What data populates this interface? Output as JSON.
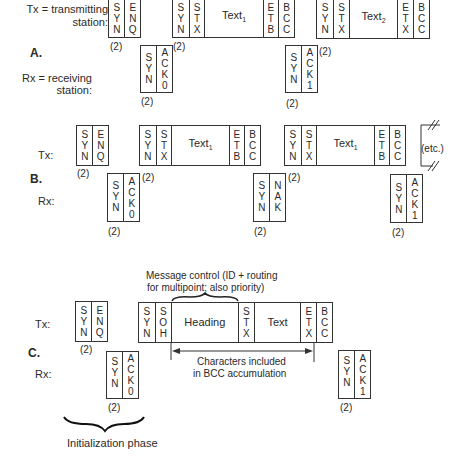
{
  "legend": {
    "tx_label": "Tx = transmitting",
    "tx_label2": "station:",
    "rx_label": "Rx = receiving",
    "rx_label2": "station:"
  },
  "sections": [
    {
      "id": "A",
      "label": "A.",
      "tx": "",
      "rx": ""
    },
    {
      "id": "B",
      "label": "B.",
      "tx": "Tx:",
      "rx": "Rx:"
    },
    {
      "id": "C",
      "label": "C.",
      "tx": "Tx:",
      "rx": "Rx:"
    }
  ],
  "frames": {
    "a_tx1": [
      "SYN",
      "ENQ"
    ],
    "a_tx2": [
      "SYN",
      "STX",
      "Text1",
      "ETB",
      "BCC"
    ],
    "a_tx3": [
      "SYN",
      "STX",
      "Text2",
      "ETX",
      "BCC"
    ],
    "a_rx1": [
      "SYN",
      "ACK0"
    ],
    "a_rx2": [
      "SYN",
      "ACK1"
    ],
    "b_tx1": [
      "SYN",
      "ENQ"
    ],
    "b_tx2": [
      "SYN",
      "STX",
      "Text1",
      "ETB",
      "BCC"
    ],
    "b_tx3": [
      "SYN",
      "STX",
      "Text1",
      "ETB",
      "BCC"
    ],
    "b_rx1": [
      "SYN",
      "ACK0"
    ],
    "b_rx2": [
      "SYN",
      "NAK"
    ],
    "b_rx3": [
      "SYN",
      "ACK1"
    ],
    "c_tx1": [
      "SYN",
      "ENQ"
    ],
    "c_tx2": [
      "SYN",
      "SOH",
      "Heading",
      "STX",
      "Text",
      "ETX",
      "BCC"
    ],
    "c_rx1": [
      "SYN",
      "ACK0"
    ],
    "c_rx2": [
      "SYN",
      "ACK1"
    ]
  },
  "text": {
    "text1": "Text",
    "text1_sub": "1",
    "text2": "Text",
    "text2_sub": "2",
    "heading": "Heading",
    "text": "Text",
    "count": "(2)",
    "etc": "(etc.)",
    "msg_control_1": "Message control (ID + routing",
    "msg_control_2": "for multipoint; also priority)",
    "bcc_1": "Characters included",
    "bcc_2": "in BCC accumulation",
    "init_phase": "Initialization phase"
  }
}
